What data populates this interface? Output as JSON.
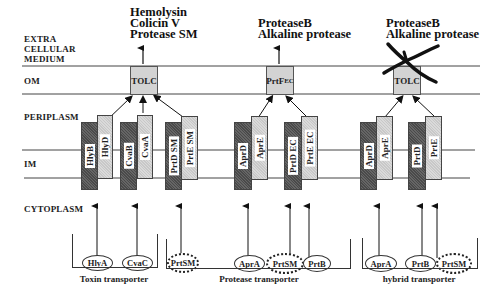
{
  "compartments": {
    "extracellular": [
      "EXTRA",
      "CELLULAR",
      "MEDIUM"
    ],
    "om": "OM",
    "periplasm": "PERIPLASM",
    "im": "IM",
    "cytoplasm": "CYTOPLASM"
  },
  "groups": [
    {
      "name": "Toxin transporter",
      "secreted": [
        "Hemolysin",
        "Colicin V",
        "Protease SM"
      ],
      "om_protein": "TOLC",
      "crossed_out": false,
      "im_pairs": [
        {
          "dark": "HlyB",
          "light": "HlyD"
        },
        {
          "dark": "CvaB",
          "light": "CvaA"
        },
        {
          "dark": "PrtD SM",
          "light": "PrtE SM"
        }
      ],
      "substrates": [
        "HlyA",
        "CvaC",
        "PrtSM"
      ]
    },
    {
      "name": "Protease transporter",
      "secreted": [
        "ProteaseB",
        "Alkaline protease"
      ],
      "om_protein": {
        "base": "PrtF",
        "sup": "EC"
      },
      "crossed_out": false,
      "im_pairs": [
        {
          "dark": "AprD",
          "light": "AprE"
        },
        {
          "dark": "PrtD EC",
          "light": "PrtE EC"
        }
      ],
      "substrates": [
        "AprA",
        "PrtSM",
        "PrtB"
      ]
    },
    {
      "name": "hybrid transporter",
      "secreted": [
        "ProteaseB",
        "Alkaline protease"
      ],
      "om_protein": "TOLC",
      "crossed_out": true,
      "im_pairs": [
        {
          "dark": "AprD",
          "light": "AprE"
        },
        {
          "dark": "PrtD",
          "light": "PrtE"
        }
      ],
      "substrates": [
        "AprA",
        "PrtB",
        "PrtSM"
      ]
    }
  ]
}
